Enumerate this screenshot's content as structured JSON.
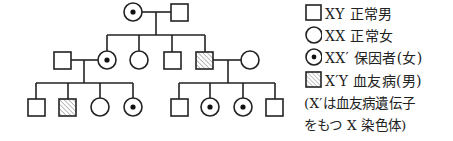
{
  "diagram": {
    "type": "pedigree",
    "colors": {
      "line": "#222222",
      "hatch": "#777777",
      "background": "#ffffff"
    },
    "generations": [
      {
        "id": "I",
        "individuals": [
          {
            "id": "I-1",
            "sex": "female",
            "phenotype": "carrier"
          },
          {
            "id": "I-2",
            "sex": "male",
            "phenotype": "normal"
          }
        ]
      },
      {
        "id": "II",
        "individuals": [
          {
            "id": "II-spouse1",
            "sex": "male",
            "phenotype": "normal",
            "married_in": true
          },
          {
            "id": "II-1",
            "sex": "female",
            "phenotype": "carrier"
          },
          {
            "id": "II-2",
            "sex": "female",
            "phenotype": "normal"
          },
          {
            "id": "II-3",
            "sex": "male",
            "phenotype": "normal"
          },
          {
            "id": "II-4",
            "sex": "male",
            "phenotype": "affected"
          },
          {
            "id": "II-spouse2",
            "sex": "female",
            "phenotype": "normal",
            "married_in": true
          }
        ]
      },
      {
        "id": "III",
        "individuals": [
          {
            "id": "III-1",
            "sex": "male",
            "phenotype": "normal",
            "parents": "II-spouse1 x II-1"
          },
          {
            "id": "III-2",
            "sex": "male",
            "phenotype": "affected",
            "parents": "II-spouse1 x II-1"
          },
          {
            "id": "III-3",
            "sex": "female",
            "phenotype": "normal",
            "parents": "II-spouse1 x II-1"
          },
          {
            "id": "III-4",
            "sex": "female",
            "phenotype": "carrier",
            "parents": "II-spouse1 x II-1"
          },
          {
            "id": "III-5",
            "sex": "male",
            "phenotype": "normal",
            "parents": "II-4 x II-spouse2"
          },
          {
            "id": "III-6",
            "sex": "female",
            "phenotype": "carrier",
            "parents": "II-4 x II-spouse2"
          },
          {
            "id": "III-7",
            "sex": "female",
            "phenotype": "carrier",
            "parents": "II-4 x II-spouse2"
          },
          {
            "id": "III-8",
            "sex": "male",
            "phenotype": "normal",
            "parents": "II-4 x II-spouse2"
          }
        ]
      }
    ]
  },
  "legend": {
    "items": [
      {
        "symbol": "square-empty",
        "label": "XY 正常男"
      },
      {
        "symbol": "circle-empty",
        "label": "XX 正常女"
      },
      {
        "symbol": "circle-dot",
        "label": "XX′ 保因者(女)"
      },
      {
        "symbol": "square-hatched",
        "label": "X′Y 血友病(男)"
      }
    ],
    "note_lines": [
      "(X′は血友病遺伝子",
      "をもつ X 染色体)"
    ]
  }
}
